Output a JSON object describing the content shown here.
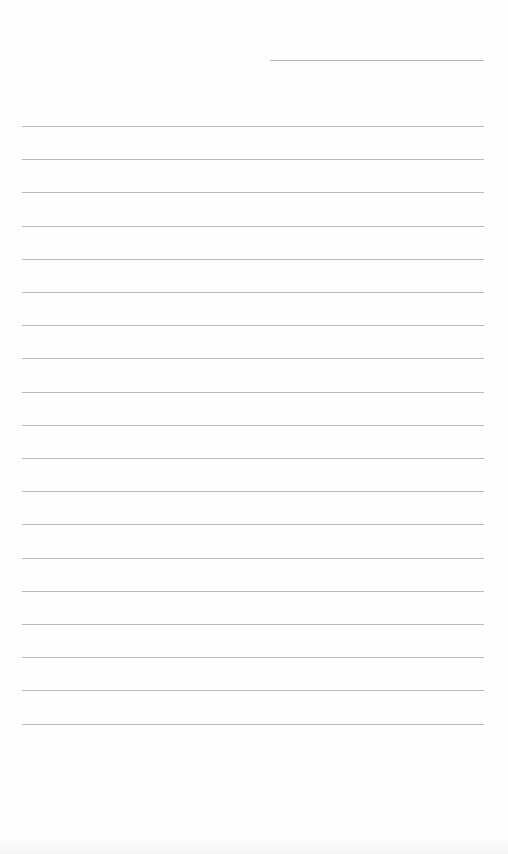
{
  "page": {
    "type": "lined-paper",
    "background": "#fefefe",
    "line_color": "#b8b8b8",
    "header_line": {
      "left": 270,
      "top": 60,
      "width": 214
    },
    "rules": {
      "count": 19,
      "left": 22,
      "width": 462,
      "first_top": 126,
      "spacing": 33.2
    },
    "text": []
  }
}
